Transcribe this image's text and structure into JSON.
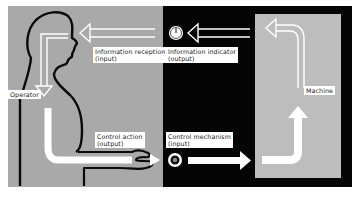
{
  "diagram": {
    "type": "man-machine system loop",
    "colors": {
      "operator_panel": "#a9a9a9",
      "center_panel": "#050505",
      "machine_panel": "#bdbdbd",
      "arrow": "#ffffff",
      "outline": "#0a0a0a",
      "label_bg": "#ffffff"
    },
    "nodes": {
      "operator": {
        "label": "Operator"
      },
      "machine": {
        "label": "Machine"
      },
      "information_reception": {
        "line1": "Information reception",
        "line2": "(input)"
      },
      "information_indicator": {
        "line1": "Information indicator",
        "line2": "(output)"
      },
      "control_action": {
        "line1": "Control action",
        "line2": "(output)"
      },
      "control_mechanism": {
        "line1": "Control mechanism",
        "line2": "(input)"
      }
    },
    "icons": {
      "indicator": "dial-gauge-icon",
      "control": "knob-icon"
    },
    "flow": [
      "Machine → Information indicator",
      "Information indicator → Information reception",
      "Information reception → Control action",
      "Control action → Control mechanism",
      "Control mechanism → Machine"
    ]
  }
}
